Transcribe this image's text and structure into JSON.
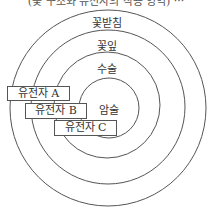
{
  "header": {
    "cut_title": "(꽃 구조와 유전자의 작용 영역) ···"
  },
  "diagram": {
    "rings": [
      {
        "label": "꽃받침",
        "radius": 98
      },
      {
        "label": "꽃잎",
        "radius": 77
      },
      {
        "label": "수술",
        "radius": 53
      },
      {
        "label": "암술",
        "radius": 30
      }
    ],
    "genes": [
      {
        "prefix": "유전자",
        "letter": "A"
      },
      {
        "prefix": "유전자",
        "letter": "B"
      },
      {
        "prefix": "유전자",
        "letter": "C"
      }
    ],
    "stroke_color": "#555555"
  }
}
